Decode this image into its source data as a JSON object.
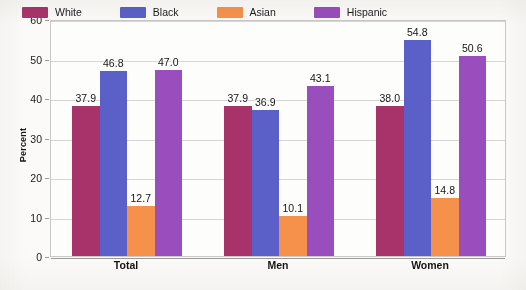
{
  "chart_data": {
    "type": "bar",
    "title": "",
    "xlabel": "",
    "ylabel": "Percent",
    "ylim": [
      0,
      60
    ],
    "ytick_step": 10,
    "yticks": [
      "0",
      "10",
      "20",
      "30",
      "40",
      "50",
      "60"
    ],
    "grid": "horizontal",
    "legend_position": "top-inside",
    "categories": [
      "Total",
      "Men",
      "Women"
    ],
    "series": [
      {
        "name": "White",
        "color": "#A8336B",
        "values": [
          37.9,
          37.9,
          38.0
        ],
        "labels": [
          "37.9",
          "37.9",
          "38.0"
        ]
      },
      {
        "name": "Black",
        "color": "#5B60C8",
        "values": [
          46.8,
          36.9,
          54.8
        ],
        "labels": [
          "46.8",
          "36.9",
          "54.8"
        ]
      },
      {
        "name": "Asian",
        "color": "#F6914C",
        "values": [
          12.7,
          10.1,
          14.8
        ],
        "labels": [
          "12.7",
          "10.1",
          "14.8"
        ]
      },
      {
        "name": "Hispanic",
        "color": "#9A4DBC",
        "values": [
          47.0,
          43.1,
          50.6
        ],
        "labels": [
          "47.0",
          "43.1",
          "50.6"
        ]
      }
    ]
  },
  "axis": {
    "y_title": "Percent"
  },
  "colors": {
    "white_series": "#A8336B",
    "black_series": "#5B60C8",
    "asian_series": "#F6914C",
    "hispanic_series": "#9A4DBC",
    "gridline": "#d6d6d6",
    "frame": "#c8c8c8",
    "background": "#fbfaf8"
  }
}
